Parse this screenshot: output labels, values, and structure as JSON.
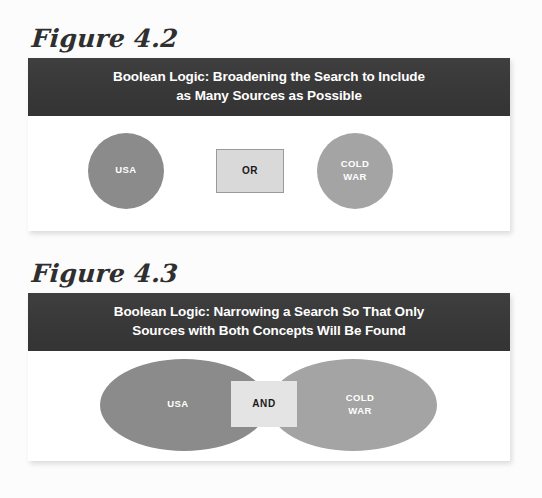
{
  "page": {
    "background_color": "#fcfcfc"
  },
  "figures": [
    {
      "id": "figure-4-2",
      "label": "Figure 4.2",
      "header": {
        "line1": "Boolean Logic: Broadening the Search to Include",
        "line2": "as Many Sources as Possible",
        "background_color": "#3a3a3a",
        "text_color": "#ffffff"
      },
      "diagram": {
        "type": "venn-disjoint",
        "operator": "OR",
        "operator_box_color": "#d9d9d9",
        "shapes": [
          {
            "label": "USA",
            "shape": "circle",
            "color": "#8b8b8b"
          },
          {
            "label_line1": "COLD",
            "label_line2": "WAR",
            "shape": "circle",
            "color": "#a4a4a4"
          }
        ]
      }
    },
    {
      "id": "figure-4-3",
      "label": "Figure 4.3",
      "header": {
        "line1": "Boolean Logic: Narrowing a Search So That Only",
        "line2": "Sources with Both Concepts Will Be Found",
        "background_color": "#3a3a3a",
        "text_color": "#ffffff"
      },
      "diagram": {
        "type": "venn-overlap",
        "operator": "AND",
        "operator_box_color": "#e4e4e4",
        "shapes": [
          {
            "label": "USA",
            "shape": "ellipse",
            "color": "#8b8b8b"
          },
          {
            "label_line1": "COLD",
            "label_line2": "WAR",
            "shape": "ellipse",
            "color": "#a4a4a4"
          }
        ]
      }
    }
  ]
}
